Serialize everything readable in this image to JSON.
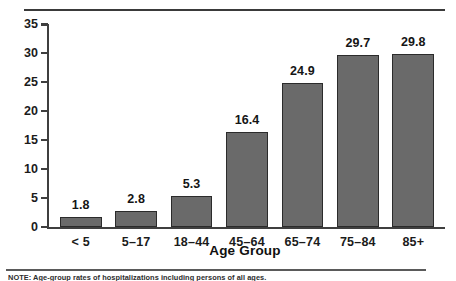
{
  "chart_data": {
    "type": "bar",
    "title": "",
    "subtitle": "",
    "xlabel": "Age Group",
    "ylabel": "",
    "categories": [
      "< 5",
      "5–17",
      "18–44",
      "45–64",
      "65–74",
      "75–84",
      "85+"
    ],
    "values": [
      1.8,
      2.8,
      5.3,
      16.4,
      24.9,
      29.7,
      29.8
    ],
    "value_labels": [
      "1.8",
      "2.8",
      "5.3",
      "16.4",
      "24.9",
      "29.7",
      "29.8"
    ],
    "ylim": [
      0,
      35
    ],
    "ytick_values": [
      0,
      5,
      10,
      15,
      20,
      25,
      30,
      35
    ],
    "ytick_labels": [
      "0",
      "5",
      "10",
      "15",
      "20",
      "25",
      "30",
      "35"
    ],
    "grid": false,
    "legend": null,
    "legend_position": "none",
    "bar_color": "#6a6a6a",
    "bar_edge_color": "#2b2b2b",
    "axis_color": "#3f3f3f",
    "data_labels_shown": true
  },
  "figure": {
    "footnote": "NOTE: Age-group rates of hospitalizations including persons of all ages.",
    "rule_color": "#3a3a3a"
  }
}
